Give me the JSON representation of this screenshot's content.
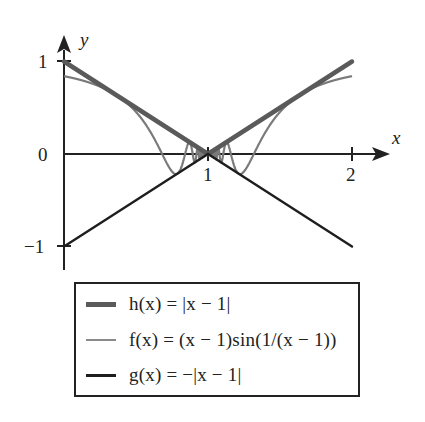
{
  "chart_data": {
    "type": "line",
    "title": "",
    "xlabel": "x",
    "ylabel": "y",
    "xlim": [
      0,
      2.2
    ],
    "ylim": [
      -1.2,
      1.2
    ],
    "grid": false,
    "legend_position": "below",
    "x_ticks": [
      {
        "value": 1,
        "label": "1"
      },
      {
        "value": 2,
        "label": "2"
      }
    ],
    "y_ticks": [
      {
        "value": 1,
        "label": "1"
      },
      {
        "value": 0,
        "label": "0"
      },
      {
        "value": -1,
        "label": "−1"
      }
    ],
    "series": [
      {
        "name": "h(x) = |x − 1|",
        "expression": "abs(x-1)",
        "domain": [
          0,
          2
        ],
        "x": [
          0,
          0.5,
          1,
          1.5,
          2
        ],
        "values": [
          1,
          0.5,
          0,
          0.5,
          1
        ],
        "color": "#5a5a5a",
        "width": 4.5
      },
      {
        "name": "f(x) = (x − 1)sin(1/(x − 1))",
        "expression": "(x-1)*sin(1/(x-1))",
        "domain": [
          0,
          2
        ],
        "x": [
          0,
          0.25,
          0.5,
          0.75,
          0.9,
          1.1,
          1.25,
          1.5,
          1.75,
          2
        ],
        "values": [
          0.841,
          0.727,
          0.455,
          -0.189,
          -0.054,
          -0.054,
          -0.189,
          0.455,
          0.727,
          0.841
        ],
        "color": "#7a7a7a",
        "width": 2.2
      },
      {
        "name": "g(x) = −|x − 1|",
        "expression": "-abs(x-1)",
        "domain": [
          0,
          2
        ],
        "x": [
          0,
          0.5,
          1,
          1.5,
          2
        ],
        "values": [
          -1,
          -0.5,
          0,
          -0.5,
          -1
        ],
        "color": "#1e1e1e",
        "width": 2.4
      }
    ]
  },
  "axes": {
    "x_label": "x",
    "y_label": "y",
    "tick_labels": {
      "x1": "1",
      "x2": "2",
      "y1": "1",
      "y0": "0",
      "ym1": "−1"
    }
  },
  "legend": {
    "items": [
      {
        "label": "h(x) = |x − 1|",
        "color": "#5a5a5a",
        "thickness": 5
      },
      {
        "label": "f(x) = (x − 1)sin(1/(x − 1))",
        "color": "#8a8a8a",
        "thickness": 2
      },
      {
        "label": "g(x) = −|x − 1|",
        "color": "#1e1e1e",
        "thickness": 3
      }
    ]
  }
}
